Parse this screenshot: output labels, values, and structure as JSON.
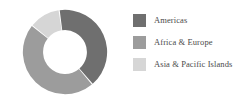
{
  "chart_data": {
    "type": "pie",
    "variant": "donut",
    "title": "",
    "subtitle": "",
    "xlabel": "",
    "ylabel": "",
    "legend_position": "right",
    "grid": false,
    "hole_ratio": 0.52,
    "start_angle_deg": -8,
    "categories": [
      "Americas",
      "Africa & Europe",
      "Asia & Pacific Islands"
    ],
    "values": [
      41,
      47,
      12
    ],
    "value_unit": "%",
    "colors": [
      "#6f6f6f",
      "#9c9c9c",
      "#d6d6d6"
    ],
    "slices": [
      {
        "label": "Americas",
        "value": 41,
        "color": "#6f6f6f"
      },
      {
        "label": "Africa & Europe",
        "value": 47,
        "color": "#9c9c9c"
      },
      {
        "label": "Asia & Pacific Islands",
        "value": 12,
        "color": "#d6d6d6"
      }
    ]
  },
  "legend": {
    "items": [
      {
        "label": "Americas",
        "color": "#6f6f6f"
      },
      {
        "label": "Africa & Europe",
        "color": "#9c9c9c"
      },
      {
        "label": "Asia & Pacific Islands",
        "color": "#d6d6d6"
      }
    ]
  },
  "style": {
    "background": "#ffffff",
    "text_color": "#4a4a4a",
    "separator_color": "#ffffff"
  }
}
